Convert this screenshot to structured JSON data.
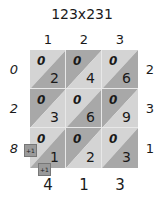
{
  "title": "123x231",
  "multiplicand_digits": [
    "1",
    "2",
    "3"
  ],
  "multiplier_digits": [
    "2",
    "3",
    "1"
  ],
  "left_result_digits": [
    "0",
    "2",
    "8"
  ],
  "bottom_result_digits": [
    "4",
    "1",
    "3"
  ],
  "cells": [
    [
      {
        "tens": "0",
        "ones": "2"
      },
      {
        "tens": "0",
        "ones": "4"
      },
      {
        "tens": "0",
        "ones": "6"
      }
    ],
    [
      {
        "tens": "0",
        "ones": "3"
      },
      {
        "tens": "0",
        "ones": "6"
      },
      {
        "tens": "0",
        "ones": "9"
      }
    ],
    [
      {
        "tens": "0",
        "ones": "1"
      },
      {
        "tens": "0",
        "ones": "2"
      },
      {
        "tens": "0",
        "ones": "3"
      }
    ]
  ],
  "carries": [
    {
      "label": "+1",
      "position": "left"
    },
    {
      "label": "+1",
      "position": "bottom"
    }
  ],
  "colors": {
    "light": "#d2d2d2",
    "mid": "#bdbdbd",
    "dark": "#9e9e9e",
    "grid_line": "#eeeeee",
    "carry_box": "#9a9a9a"
  }
}
